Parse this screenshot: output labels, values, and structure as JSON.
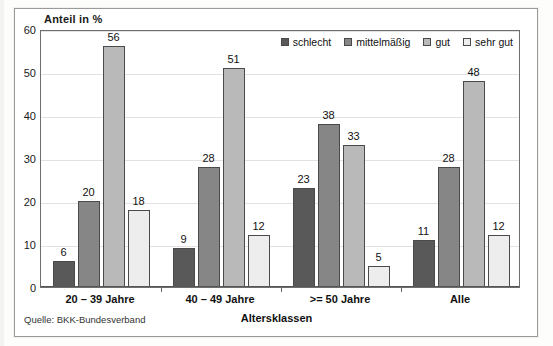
{
  "chart_data": {
    "type": "bar",
    "title": "",
    "ylabel": "Anteil in %",
    "xlabel": "Altersklassen",
    "ylim": [
      0,
      60
    ],
    "yticks": [
      0,
      10,
      20,
      30,
      40,
      50,
      60
    ],
    "grid": true,
    "legend_position": "top-right-inside",
    "categories": [
      "20 – 39 Jahre",
      "40 – 49 Jahre",
      ">= 50 Jahre",
      "Alle"
    ],
    "series": [
      {
        "name": "schlecht",
        "color": "#595959",
        "values": [
          6,
          9,
          23,
          11
        ]
      },
      {
        "name": "mittelmäßig",
        "color": "#868686",
        "values": [
          20,
          28,
          38,
          28
        ]
      },
      {
        "name": "gut",
        "color": "#b9b9b9",
        "values": [
          56,
          51,
          33,
          48
        ]
      },
      {
        "name": "sehr gut",
        "color": "#ededed",
        "values": [
          18,
          12,
          5,
          12
        ]
      }
    ],
    "annotations": {
      "source": "Quelle: BKK-Bundesverband"
    }
  },
  "axes": {
    "y_title": "Anteil in %",
    "x_title": "Altersklassen",
    "y_tick_labels": [
      "60",
      "50",
      "40",
      "30",
      "20",
      "10",
      "0"
    ]
  },
  "legend": {
    "items": [
      {
        "label": "schlecht"
      },
      {
        "label": "mittelmäßig"
      },
      {
        "label": "gut"
      },
      {
        "label": "sehr gut"
      }
    ]
  },
  "footer": {
    "source": "Quelle: BKK-Bundesverband"
  }
}
